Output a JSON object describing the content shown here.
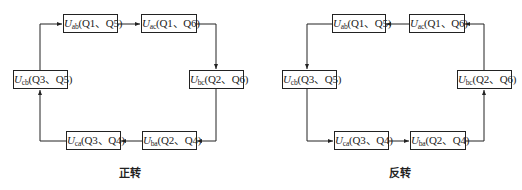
{
  "diagrams": {
    "forward": {
      "caption": "正转",
      "states": [
        {
          "id": "ab",
          "var": "U",
          "sub": "ab",
          "switches": "(Q1、Q5)"
        },
        {
          "id": "ac",
          "var": "U",
          "sub": "ac",
          "switches": "(Q1、Q6)"
        },
        {
          "id": "bc",
          "var": "U",
          "sub": "bc",
          "switches": "(Q2、Q6)"
        },
        {
          "id": "ba",
          "var": "U",
          "sub": "ba",
          "switches": "(Q2、Q4)"
        },
        {
          "id": "ca",
          "var": "U",
          "sub": "ca",
          "switches": "(Q3、Q4)"
        },
        {
          "id": "cb",
          "var": "U",
          "sub": "cb",
          "switches": "(Q3、Q5)"
        }
      ],
      "sequence": [
        "ab",
        "ac",
        "bc",
        "ba",
        "ca",
        "cb",
        "ab"
      ],
      "direction": "clockwise"
    },
    "reverse": {
      "caption": "反转",
      "states": [
        {
          "id": "ab",
          "var": "U",
          "sub": "ab",
          "switches": "(Q1、Q5)"
        },
        {
          "id": "ac",
          "var": "U",
          "sub": "ac",
          "switches": "(Q1、Q6)"
        },
        {
          "id": "bc",
          "var": "U",
          "sub": "bc",
          "switches": "(Q2、Q6)"
        },
        {
          "id": "ba",
          "var": "U",
          "sub": "ba",
          "switches": "(Q2、Q4)"
        },
        {
          "id": "ca",
          "var": "U",
          "sub": "ca",
          "switches": "(Q3、Q4)"
        },
        {
          "id": "cb",
          "var": "U",
          "sub": "cb",
          "switches": "(Q3、Q5)"
        }
      ],
      "sequence": [
        "ab",
        "cb",
        "ca",
        "ba",
        "bc",
        "ac",
        "ab"
      ],
      "direction": "counterclockwise"
    }
  },
  "colors": {
    "line": "#222222",
    "background": "#ffffff"
  }
}
